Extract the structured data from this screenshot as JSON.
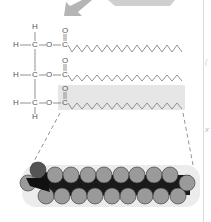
{
  "diagram": {
    "type": "triglyceride-structure",
    "atoms": {
      "h": "H",
      "c": "C",
      "o": "O"
    },
    "rows": [
      {
        "y": 45,
        "label_h": "H",
        "label_c": "C",
        "label_o": "O",
        "label_carbonyl_c": "C",
        "label_carbonyl_o": "O"
      },
      {
        "y": 75,
        "label_h": "H",
        "label_c": "C",
        "label_o": "O",
        "label_carbonyl_c": "C",
        "label_carbonyl_o": "O"
      },
      {
        "y": 103,
        "label_h": "H",
        "label_c": "C",
        "label_o": "O",
        "label_carbonyl_c": "C",
        "label_carbonyl_o": "O"
      }
    ],
    "top_h": "H",
    "bottom_h": "H",
    "side_marks": [
      "(",
      "x"
    ],
    "colors": {
      "line": "#777777",
      "highlight": "#e6e6e6",
      "arrow": "#b5b5b5",
      "sphere": "#9a9a9a",
      "sphere_dark": "#111111",
      "divider": "#dcdcdc"
    }
  }
}
